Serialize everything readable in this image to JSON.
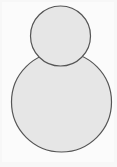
{
  "figure": {
    "shapes": [
      {
        "name": "large-circle",
        "fill": "#e6e6e6",
        "stroke": "#555555"
      },
      {
        "name": "small-circle",
        "fill": "#e6e6e6",
        "stroke": "#555555"
      }
    ],
    "background": "#f7f7f7"
  }
}
